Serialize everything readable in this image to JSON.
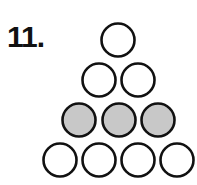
{
  "problem": {
    "number_label": "11."
  },
  "figure": {
    "rows": [
      {
        "count": 1,
        "shaded": false,
        "cy": 40,
        "cx": [
          118
        ]
      },
      {
        "count": 2,
        "shaded": false,
        "cy": 80,
        "cx": [
          99,
          138
        ]
      },
      {
        "count": 3,
        "shaded": true,
        "cy": 120,
        "cx": [
          79,
          119,
          158
        ]
      },
      {
        "count": 4,
        "shaded": false,
        "cy": 160,
        "cx": [
          60,
          99,
          138,
          177
        ]
      }
    ],
    "radius": 16.5,
    "stroke_color": "#111111",
    "shade_color": "#c8c8c8",
    "empty_color": "#ffffff"
  }
}
